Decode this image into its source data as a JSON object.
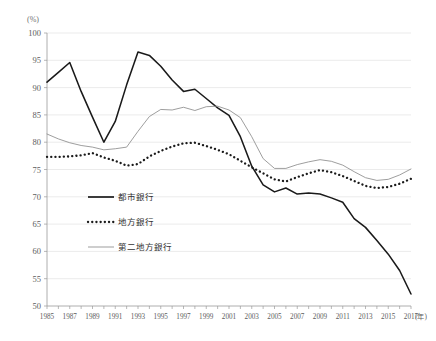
{
  "chart_data": {
    "type": "line",
    "title": "",
    "xlabel": "(年)",
    "ylabel": "(%)",
    "xlim": [
      1985,
      2017
    ],
    "ylim": [
      50,
      100
    ],
    "ytick_step": 5,
    "yticks": [
      50,
      55,
      60,
      65,
      70,
      75,
      80,
      85,
      90,
      95,
      100
    ],
    "xticks_labeled": [
      1985,
      1987,
      1989,
      1991,
      1993,
      1995,
      1997,
      1999,
      2001,
      2003,
      2005,
      2007,
      2009,
      2011,
      2013,
      2015,
      2017
    ],
    "x": [
      1985,
      1986,
      1987,
      1988,
      1989,
      1990,
      1991,
      1992,
      1993,
      1994,
      1995,
      1996,
      1997,
      1998,
      1999,
      2000,
      2001,
      2002,
      2003,
      2004,
      2005,
      2006,
      2007,
      2008,
      2009,
      2010,
      2011,
      2012,
      2013,
      2014,
      2015,
      2016,
      2017
    ],
    "grid": "horizontal",
    "legend_position": "inner-left-lower",
    "series": [
      {
        "name": "都市銀行",
        "style": "solid",
        "color": "#1a1a1a",
        "values": [
          91.0,
          92.8,
          94.6,
          89.3,
          84.6,
          80.0,
          83.8,
          90.5,
          96.5,
          95.9,
          93.9,
          91.4,
          89.3,
          89.7,
          88.0,
          86.3,
          84.9,
          81.0,
          75.6,
          72.2,
          70.9,
          71.6,
          70.5,
          70.7,
          70.5,
          69.8,
          69.0,
          66.0,
          64.4,
          62.0,
          59.5,
          56.5,
          52.2
        ]
      },
      {
        "name": "地方銀行",
        "style": "dotted",
        "color": "#1a1a1a",
        "values": [
          77.3,
          77.3,
          77.4,
          77.6,
          78.0,
          77.2,
          76.6,
          75.7,
          76.0,
          77.4,
          78.4,
          79.2,
          79.8,
          79.9,
          79.3,
          78.6,
          77.8,
          76.6,
          75.4,
          74.3,
          73.2,
          72.8,
          73.6,
          74.3,
          74.9,
          74.5,
          73.8,
          72.9,
          72.0,
          71.6,
          71.8,
          72.4,
          73.3
        ]
      },
      {
        "name": "第二地方銀行",
        "style": "thin-solid",
        "color": "#8d8d8d",
        "values": [
          81.5,
          80.6,
          79.9,
          79.4,
          79.1,
          78.6,
          78.8,
          79.1,
          82.0,
          84.7,
          86.0,
          85.9,
          86.4,
          85.8,
          86.5,
          86.6,
          85.9,
          84.5,
          81.0,
          77.0,
          75.2,
          75.2,
          75.9,
          76.4,
          76.8,
          76.5,
          75.8,
          74.6,
          73.5,
          73.0,
          73.2,
          74.0,
          75.1
        ]
      }
    ]
  },
  "legend": {
    "items": [
      {
        "label": "都市銀行"
      },
      {
        "label": "地方銀行"
      },
      {
        "label": "第二地方銀行"
      }
    ]
  }
}
